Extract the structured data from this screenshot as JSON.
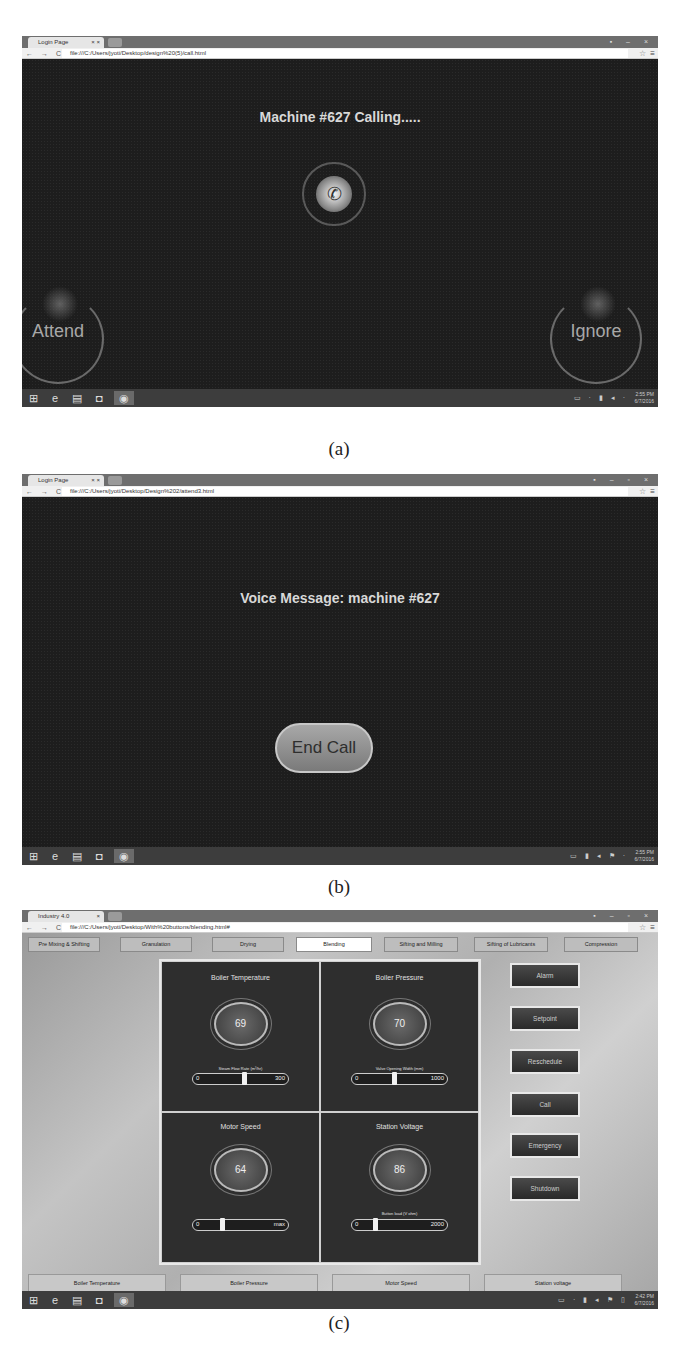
{
  "figure_a": {
    "caption": "(a)",
    "browser": {
      "tab_title": "Login Page",
      "tab_close": "× ×",
      "url": "file:///C:/Users/jyoti/Desktop/design%20(5)/call.html",
      "nav": "← → C",
      "window_controls": "▪ – ×"
    },
    "call_title": "Machine #627 Calling.....",
    "phone_icon": "✆",
    "attend_label": "Attend",
    "ignore_label": "Ignore",
    "taskbar": {
      "tray": "▭ · ▮ ◂ ·",
      "clock_time": "2:55 PM",
      "clock_date": "6/7/2016"
    }
  },
  "figure_b": {
    "caption": "(b)",
    "browser": {
      "tab_title": "Login Page",
      "tab_close": "× ×",
      "url": "file:///C:/Users/jyoti/Desktop/Design%202/attend3.html",
      "nav": "← → C",
      "window_controls": "▪ – ▫ ×"
    },
    "voice_title": "Voice Message: machine #627",
    "end_call_label": "End Call",
    "taskbar": {
      "tray": "▭ ▮ ◂ ⚑ ·",
      "clock_time": "2:55 PM",
      "clock_date": "6/7/2016"
    }
  },
  "figure_c": {
    "caption": "(c)",
    "browser": {
      "tab_title": "Industry 4.0",
      "tab_close": "×",
      "url": "file:///C:/Users/jyoti/Desktop/With%20buttons/blending.html#",
      "nav": "← → C",
      "window_controls": "▪ – ▫ ×"
    },
    "stage_tabs": [
      {
        "label": "Pre Mixing & Shifting"
      },
      {
        "label": "Granulation"
      },
      {
        "label": "Drying"
      },
      {
        "label": "Blending"
      },
      {
        "label": "Sifting and Milling"
      },
      {
        "label": "Sifting of Lubricants"
      },
      {
        "label": "Compression"
      }
    ],
    "active_stage": "Blending",
    "gauges": [
      {
        "title": "Boiler Temperature",
        "value": "69",
        "slider_label": "Steam Flow Rate (m³/hr)",
        "min": "0",
        "max": "300"
      },
      {
        "title": "Boiler Pressure",
        "value": "70",
        "slider_label": "Valve Opening Width (mm)",
        "min": "0",
        "max": "1000"
      },
      {
        "title": "Motor Speed",
        "value": "64",
        "slider_label": "",
        "min": "0",
        "max": "max"
      },
      {
        "title": "Station Voltage",
        "value": "86",
        "slider_label": "Button load (V ohm)",
        "min": "0",
        "max": "2000"
      }
    ],
    "actions": [
      {
        "label": "Alarm"
      },
      {
        "label": "Setpoint"
      },
      {
        "label": "Reschedule"
      },
      {
        "label": "Call"
      },
      {
        "label": "Emergency"
      },
      {
        "label": "Shutdown"
      }
    ],
    "metric_buttons": [
      {
        "label": "Boiler Temperature"
      },
      {
        "label": "Boiler Pressure"
      },
      {
        "label": "Motor Speed"
      },
      {
        "label": "Station voltage"
      }
    ],
    "taskbar": {
      "tray": "▭ · ▮ ◂ ⚑ ▯",
      "clock_time": "2:42 PM",
      "clock_date": "6/7/2016"
    }
  },
  "taskbar_icons": {
    "start": "⊞",
    "ie": "e",
    "explorer": "▤",
    "store": "◘",
    "chrome": "◉"
  },
  "colors": {
    "dark_bg": "#1d1d1d",
    "taskbar": "#3d3d3d",
    "accent_active_tab": "#ffffff"
  }
}
